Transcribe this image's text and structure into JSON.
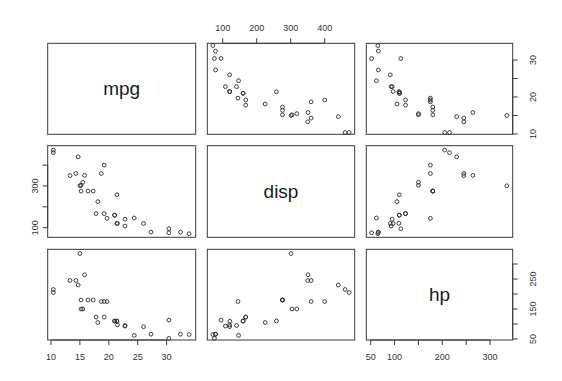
{
  "chart_data": {
    "type": "scatter",
    "title": "",
    "kind": "scatterplot-matrix",
    "variables": [
      "mpg",
      "disp",
      "hp"
    ],
    "diagonal_labels": [
      "mpg",
      "disp",
      "hp"
    ],
    "grid": false,
    "legend": "none",
    "axes": {
      "mpg": {
        "range": [
          10,
          34
        ],
        "ticks": [
          10,
          15,
          20,
          25,
          30
        ],
        "tick_labels_bottom": [
          "10",
          "15",
          "20",
          "25",
          "30"
        ],
        "ticks_side": [
          10,
          15,
          20,
          25,
          30
        ],
        "tick_labels_side": [
          "10",
          "20",
          "30"
        ]
      },
      "disp": {
        "range": [
          71.1,
          472
        ],
        "ticks": [
          100,
          200,
          300,
          400
        ],
        "tick_labels_top": [
          "100",
          "200",
          "300",
          "400"
        ],
        "tick_labels_side": [
          "100",
          "300"
        ]
      },
      "hp": {
        "range": [
          52,
          335
        ],
        "ticks": [
          50,
          100,
          150,
          200,
          250,
          300
        ],
        "tick_labels_bottom": [
          "50",
          "100",
          "200",
          "300"
        ],
        "tick_labels_side": [
          "50",
          "150",
          "250"
        ]
      }
    },
    "axis_placement": {
      "mpg_x": "bottom",
      "disp_x": "top",
      "hp_x": "bottom",
      "mpg_y": "right",
      "disp_y": "left",
      "hp_y": "right"
    },
    "series": [
      {
        "name": "mpg",
        "values": [
          21.0,
          21.0,
          22.8,
          21.4,
          18.7,
          18.1,
          14.3,
          24.4,
          22.8,
          19.2,
          17.8,
          16.4,
          17.3,
          15.2,
          10.4,
          10.4,
          14.7,
          32.4,
          30.4,
          33.9,
          21.5,
          15.5,
          15.2,
          13.3,
          19.2,
          27.3,
          26.0,
          30.4,
          15.8,
          19.7,
          15.0,
          21.4
        ]
      },
      {
        "name": "disp",
        "values": [
          160,
          160,
          108,
          258,
          360,
          225,
          360,
          146.7,
          140.8,
          167.6,
          167.6,
          275.8,
          275.8,
          275.8,
          472,
          460,
          440,
          78.7,
          75.7,
          71.1,
          120.1,
          318,
          304,
          350,
          400,
          79,
          120.3,
          95.1,
          351,
          145,
          301,
          121
        ]
      },
      {
        "name": "hp",
        "values": [
          110,
          110,
          93,
          110,
          175,
          105,
          245,
          62,
          95,
          123,
          123,
          180,
          180,
          180,
          205,
          215,
          230,
          66,
          52,
          65,
          97,
          150,
          150,
          245,
          175,
          66,
          91,
          113,
          264,
          175,
          335,
          109
        ]
      }
    ],
    "marker": "open-circle",
    "colors": {
      "points": "#2a2a2a",
      "frame": "#3a3a3a",
      "text": "#333333"
    }
  }
}
